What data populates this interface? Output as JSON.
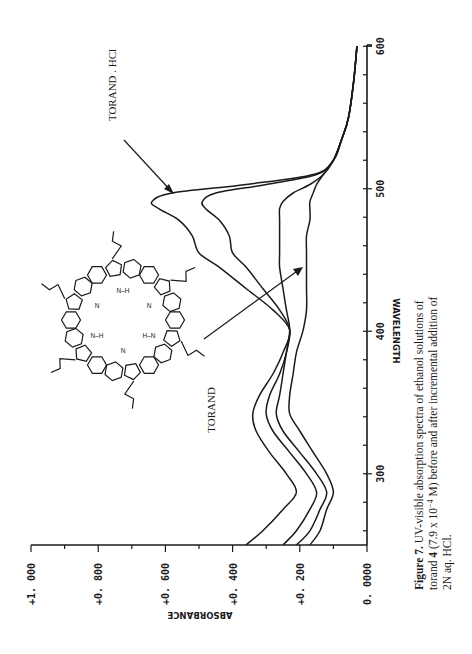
{
  "chart_data": {
    "type": "line",
    "orientation": "rotated 90 degrees counter-clockwise on the page (wavelength axis runs vertically along the right edge, absorbance axis along the bottom reading right-to-left)",
    "title": "",
    "xlabel": "WAVELENGTH",
    "ylabel": "ABSORBANCE",
    "xlim": [
      250,
      600
    ],
    "ylim": [
      0,
      1.0
    ],
    "x_ticks": [
      "300",
      "400",
      "500",
      "600"
    ],
    "y_ticks": [
      "0.0000",
      "+0.200",
      "+0.400",
      "+0.600",
      "+0.800",
      "+1.000"
    ],
    "y_tick_labels_as_shown": [
      "0. 0000",
      "+0. 200",
      "+0. 400",
      "+0. 600",
      "+0. 800",
      "+1. 000"
    ],
    "grid": false,
    "legend": "none (curves identified by arrows/annotations)",
    "x": [
      250,
      260,
      275,
      287,
      300,
      315,
      330,
      342,
      355,
      370,
      385,
      401,
      415,
      430,
      445,
      455,
      467,
      478,
      486,
      491,
      497,
      503,
      510,
      520,
      535,
      550,
      575,
      600
    ],
    "series": [
      {
        "name": "TORAND . HCl (final addition)",
        "values": [
          0.36,
          0.31,
          0.25,
          0.21,
          0.24,
          0.29,
          0.33,
          0.34,
          0.32,
          0.28,
          0.25,
          0.23,
          0.28,
          0.36,
          0.44,
          0.5,
          0.52,
          0.56,
          0.62,
          0.64,
          0.58,
          0.36,
          0.16,
          0.1,
          0.075,
          0.055,
          0.04,
          0.03
        ]
      },
      {
        "name": "intermediate HCl addition 2",
        "values": [
          0.25,
          0.21,
          0.17,
          0.15,
          0.18,
          0.23,
          0.28,
          0.3,
          0.29,
          0.26,
          0.24,
          0.23,
          0.26,
          0.31,
          0.36,
          0.4,
          0.41,
          0.44,
          0.48,
          0.49,
          0.45,
          0.3,
          0.15,
          0.1,
          0.075,
          0.055,
          0.04,
          0.03
        ]
      },
      {
        "name": "intermediate HCl addition 1",
        "values": [
          0.21,
          0.17,
          0.14,
          0.12,
          0.15,
          0.2,
          0.25,
          0.27,
          0.26,
          0.25,
          0.24,
          0.23,
          0.24,
          0.25,
          0.26,
          0.26,
          0.26,
          0.26,
          0.26,
          0.25,
          0.22,
          0.17,
          0.13,
          0.1,
          0.075,
          0.055,
          0.04,
          0.03
        ]
      },
      {
        "name": "TORAND (free base)",
        "values": [
          0.17,
          0.14,
          0.12,
          0.1,
          0.12,
          0.16,
          0.2,
          0.23,
          0.23,
          0.22,
          0.21,
          0.19,
          0.18,
          0.18,
          0.18,
          0.18,
          0.18,
          0.17,
          0.17,
          0.17,
          0.16,
          0.15,
          0.13,
          0.1,
          0.075,
          0.055,
          0.04,
          0.03
        ]
      }
    ],
    "annotations": [
      {
        "text": "TORAND . HCl",
        "points_to": "highest-absorbance curve near 491 nm"
      },
      {
        "text": "TORAND",
        "points_to": "lowest curve near 450 nm"
      }
    ]
  },
  "figure": {
    "annotation_hcl": "TORAND . HCl",
    "annotation_torand": "TORAND",
    "caption_line1": "Figure 7.  UV-visible absorption spectra of ethanol solutions of",
    "caption_line2_pre": "torand ",
    "caption_line2_bold": "4",
    "caption_line2_post": " (7.9 x 10",
    "caption_line2_sup": "−4",
    "caption_line2_end": " M) before and after incremental addition of",
    "caption_line3": "2N aq. HCl.",
    "molecule_labels": {
      "nh": "N–H",
      "hn": "H–N",
      "n": "N"
    }
  }
}
